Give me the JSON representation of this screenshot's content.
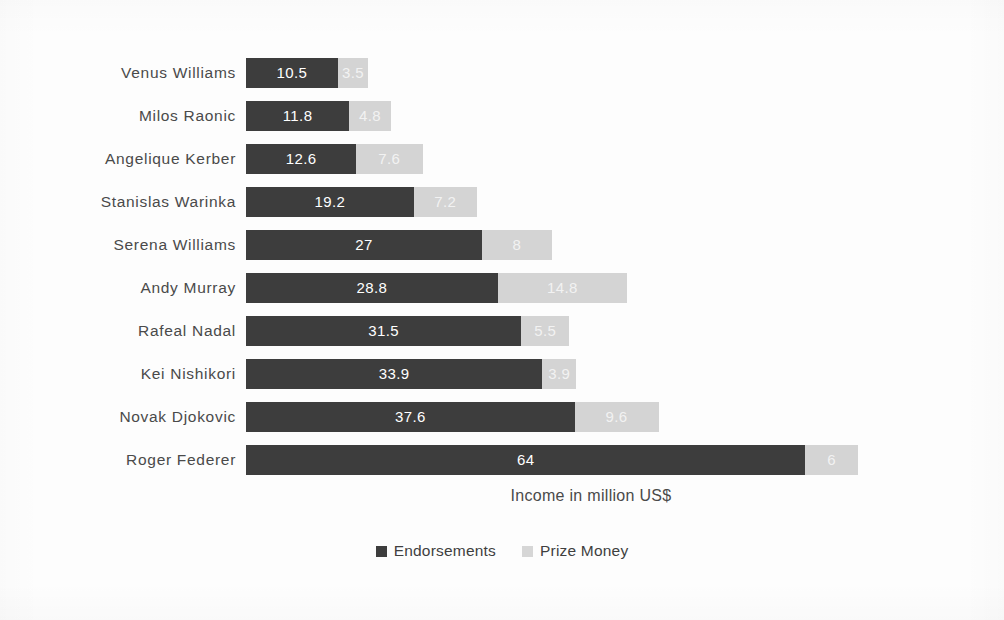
{
  "chart_data": {
    "type": "bar",
    "orientation": "horizontal",
    "stacked": true,
    "title": "",
    "xlabel": "Income in million US$",
    "ylabel": "",
    "xlim": [
      0,
      70
    ],
    "grid": false,
    "legend_position": "bottom",
    "categories": [
      "Venus Williams",
      "Milos Raonic",
      "Angelique Kerber",
      "Stanislas Warinka",
      "Serena Williams",
      "Andy Murray",
      "Rafeal Nadal",
      "Kei Nishikori",
      "Novak Djokovic",
      "Roger Federer"
    ],
    "series": [
      {
        "name": "Endorsements",
        "color": "#3d3d3d",
        "values": [
          10.5,
          11.8,
          12.6,
          19.2,
          27,
          28.8,
          31.5,
          33.9,
          37.6,
          64
        ],
        "labels": [
          "10.5",
          "11.8",
          "12.6",
          "19.2",
          "27",
          "28.8",
          "31.5",
          "33.9",
          "37.6",
          "64"
        ]
      },
      {
        "name": "Prize Money",
        "color": "#d4d4d4",
        "values": [
          3.5,
          4.8,
          7.6,
          7.2,
          8,
          14.8,
          5.5,
          3.9,
          9.6,
          6
        ],
        "labels": [
          "3.5",
          "4.8",
          "7.6",
          "7.2",
          "8",
          "14.8",
          "5.5",
          "3.9",
          "9.6",
          "6"
        ]
      }
    ]
  },
  "legend": {
    "items": [
      {
        "label": "Endorsements"
      },
      {
        "label": "Prize Money"
      }
    ]
  },
  "axis": {
    "x_title": "Income in million US$"
  }
}
